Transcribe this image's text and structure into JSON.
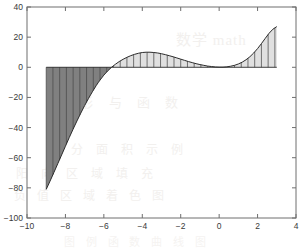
{
  "figure": {
    "background_color": "#ffffff",
    "axis_color": "#6e6e6e",
    "tick_text_color": "#3a3a3a",
    "curve_color": "#2b2b2b",
    "negative_fill_color": "#808080",
    "positive_fill_color": "#e0e0e0",
    "hatch_color": "#4a4a4a"
  },
  "watermarks": {
    "line1": "数学 math",
    "line2": "图 形 与 函 数",
    "line3": "积 分 面 积 示 例",
    "line4": "阳 向 区 域 填 充",
    "line5": "负 值 区 域 着 色 图",
    "line6": "图 例 函 数 曲 线 图"
  },
  "chart_data": {
    "type": "area",
    "title": "",
    "subtitle": "",
    "xlabel": "",
    "ylabel": "",
    "xlim": [
      -10,
      4
    ],
    "ylim": [
      -100,
      40
    ],
    "xticks": [
      -10,
      -8,
      -6,
      -4,
      -2,
      0,
      2,
      4
    ],
    "xtick_labels": [
      "−10",
      "−8",
      "−6",
      "−4",
      "−2",
      "0",
      "2",
      "4"
    ],
    "yticks": [
      -100,
      -80,
      -60,
      -40,
      -20,
      0,
      20,
      40
    ],
    "ytick_labels": [
      "−100",
      "−80",
      "−60",
      "−40",
      "−20",
      "0",
      "20",
      "40"
    ],
    "grid": false,
    "legend": null,
    "legend_position": "none",
    "zero_line": 0,
    "hatch_pattern": "vertical-lines",
    "hatch_spacing_x": 0.35,
    "series": [
      {
        "name": "f(x)",
        "fill_below_zero_color": "#808080",
        "fill_above_zero_color": "#e0e0e0",
        "x_start": -9.0,
        "x_end": 3.0,
        "x": [
          -9.0,
          -8.8,
          -8.6,
          -8.4,
          -8.2,
          -8.0,
          -7.8,
          -7.6,
          -7.4,
          -7.2,
          -7.0,
          -6.8,
          -6.6,
          -6.4,
          -6.3,
          -6.2,
          -6.0,
          -5.8,
          -5.6,
          -5.4,
          -5.2,
          -5.0,
          -4.8,
          -4.6,
          -4.4,
          -4.2,
          -4.0,
          -3.8,
          -3.6,
          -3.4,
          -3.2,
          -3.0,
          -2.8,
          -2.6,
          -2.4,
          -2.2,
          -2.0,
          -1.8,
          -1.6,
          -1.4,
          -1.2,
          -1.0,
          -0.8,
          -0.6,
          -0.4,
          -0.2,
          0.0,
          0.2,
          0.4,
          0.6,
          0.8,
          1.0,
          1.2,
          1.4,
          1.6,
          1.8,
          2.0,
          2.2,
          2.4,
          2.6,
          2.8,
          3.0
        ],
        "y": [
          -81.0,
          -75.5,
          -69.8,
          -64.0,
          -58.2,
          -52.4,
          -46.6,
          -41.0,
          -35.6,
          -30.4,
          -25.4,
          -20.7,
          -16.3,
          -12.2,
          -10.3,
          -8.5,
          -5.2,
          -2.4,
          0.0,
          2.0,
          3.8,
          5.3,
          6.6,
          7.7,
          8.6,
          9.3,
          9.8,
          10.0,
          10.0,
          9.8,
          9.5,
          9.0,
          8.4,
          7.7,
          7.0,
          6.2,
          5.4,
          4.6,
          3.8,
          3.1,
          2.4,
          1.8,
          1.3,
          0.8,
          0.5,
          0.2,
          0.1,
          0.1,
          0.3,
          0.7,
          1.3,
          2.2,
          3.4,
          5.0,
          7.0,
          9.5,
          12.4,
          15.7,
          19.2,
          22.6,
          25.3,
          27.0
        ],
        "peak_negative": {
          "x": -9.0,
          "y": -81.0
        },
        "local_max": {
          "x": -3.7,
          "y": 10.0
        },
        "local_min": {
          "x": 0.1,
          "y": 0.1
        },
        "peak_positive": {
          "x": 3.0,
          "y": 27.0
        },
        "zero_crossing": [
          -5.6
        ]
      }
    ]
  }
}
